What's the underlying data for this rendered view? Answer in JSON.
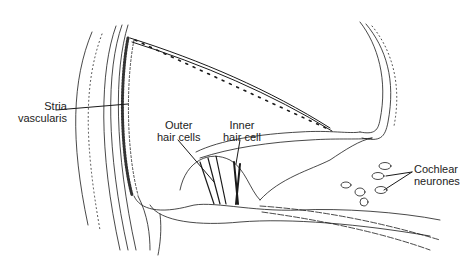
{
  "figure": {
    "type": "anatomical cross-section illustration",
    "background": "#ffffff",
    "ink": "#1a1a1a"
  },
  "labels": [
    {
      "id": "stria",
      "lines": [
        "Stria",
        "vascularis"
      ],
      "x": 28,
      "y": 110
    },
    {
      "id": "outer_hair",
      "lines": [
        "Outer",
        "hair cells"
      ],
      "x": 172,
      "y": 122
    },
    {
      "id": "inner_hair",
      "lines": [
        "Inner",
        "hair cell"
      ],
      "x": 238,
      "y": 122
    },
    {
      "id": "cochlear_neurones",
      "lines": [
        "Cochlear",
        "neurones"
      ],
      "x": 413,
      "y": 167
    }
  ]
}
